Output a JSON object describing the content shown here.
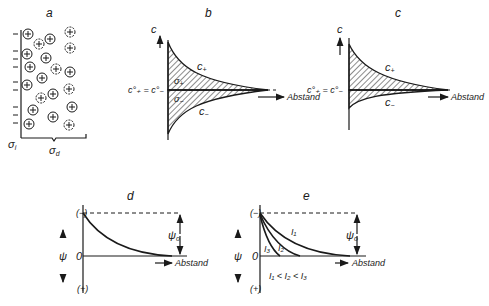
{
  "panels": {
    "a": {
      "label": "a",
      "sigma_i": "σ",
      "sigma_i_sub": "i",
      "sigma_d": "σ",
      "sigma_d_sub": "d",
      "cation_symbol": "+",
      "anion_symbol": "solvated-anion"
    },
    "b": {
      "label": "b",
      "y_axis": "c",
      "c_plus": "c",
      "c_plus_sub": "+",
      "c_minus": "c",
      "c_minus_sub": "−",
      "sigma_plus": "σ",
      "sigma_plus_sub": "+",
      "sigma_minus": "σ",
      "sigma_minus_sub": "−",
      "bulk_eq": "c°₊ = c°₋",
      "x_axis": "Abstand"
    },
    "c": {
      "label": "c",
      "y_axis": "c",
      "c_plus": "c",
      "c_plus_sub": "+",
      "c_minus": "c",
      "c_minus_sub": "−",
      "bulk_eq": "c°₊ = c°₋",
      "x_axis": "Abstand"
    },
    "d": {
      "label": "d",
      "y_top": "(−)",
      "y_bottom": "(+)",
      "y_zero": "0",
      "y_axis": "ψ",
      "psi0": "ψ",
      "psi0_sub": "o",
      "x_axis": "Abstand"
    },
    "e": {
      "label": "e",
      "y_top": "(−)",
      "y_bottom": "(+)",
      "y_zero": "0",
      "y_axis": "ψ",
      "psi0": "ψ",
      "psi0_sub": "o",
      "curves": [
        "I₁",
        "I₂",
        "I₃"
      ],
      "relation": "I₁ < I₂ < I₃",
      "x_axis": "Abstand"
    }
  }
}
